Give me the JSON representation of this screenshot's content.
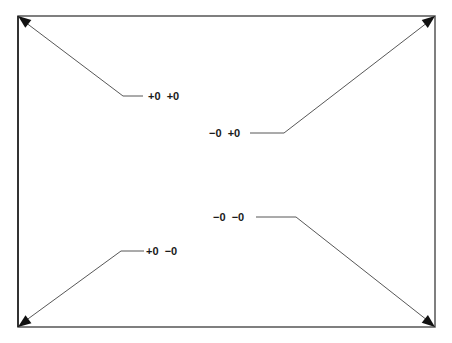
{
  "diagram": {
    "frame": {
      "left": 18,
      "top": 16,
      "right": 435,
      "bottom": 327,
      "stroke": "#555555"
    },
    "callouts": [
      {
        "id": "top-left",
        "label": "+0  +0",
        "label_x": 148,
        "label_y": 90,
        "path": "M143,96 L123,96 L21,19",
        "tip": [
          18,
          16
        ]
      },
      {
        "id": "top-right",
        "label": "−0  +0",
        "label_x": 209,
        "label_y": 127,
        "path": "M250,133 L284,133 L432,19",
        "tip": [
          435,
          16
        ]
      },
      {
        "id": "bottom-right",
        "label": "−0  −0",
        "label_x": 213,
        "label_y": 211,
        "path": "M256,217 L296,217 L432,324",
        "tip": [
          435,
          327
        ]
      },
      {
        "id": "bottom-left",
        "label": "+0  −0",
        "label_x": 146,
        "label_y": 245,
        "path": "M144,251 L121,251 L21,324",
        "tip": [
          18,
          327
        ]
      }
    ]
  }
}
